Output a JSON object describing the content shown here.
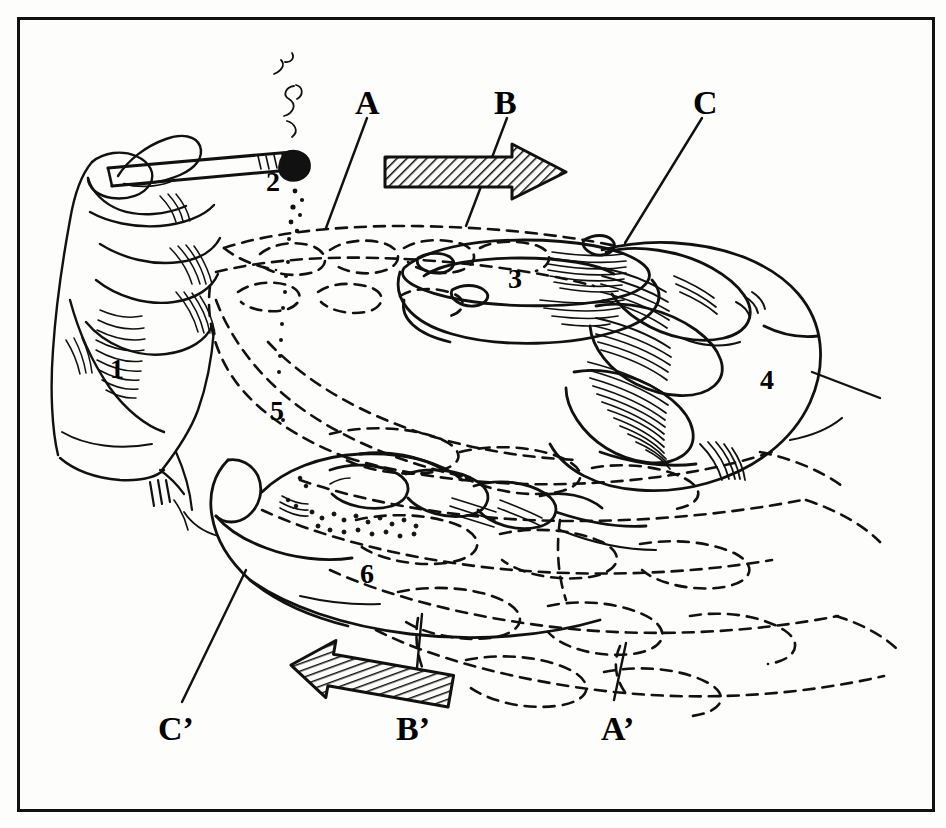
{
  "figure": {
    "type": "technical-line-illustration",
    "background_color": "#fdfdfb",
    "ink_color": "#111111",
    "frame": {
      "stroke": "#111111",
      "width_px": 3
    }
  },
  "section_labels": [
    {
      "id": "A",
      "text": "A",
      "x": 355,
      "y": 86,
      "leader_to": {
        "x": 326,
        "y": 228
      }
    },
    {
      "id": "B",
      "text": "B",
      "x": 494,
      "y": 86,
      "leader_to": {
        "x": 466,
        "y": 226
      }
    },
    {
      "id": "C",
      "text": "C",
      "x": 693,
      "y": 86,
      "leader_to": {
        "x": 625,
        "y": 243
      }
    },
    {
      "id": "Cp",
      "text": "C’",
      "x": 158,
      "y": 712,
      "leader_to": {
        "x": 246,
        "y": 570
      }
    },
    {
      "id": "Bp",
      "text": "B’",
      "x": 396,
      "y": 712,
      "leader_to": {
        "x": 418,
        "y": 618
      }
    },
    {
      "id": "Ap",
      "text": "A’",
      "x": 601,
      "y": 712,
      "leader_to": {
        "x": 620,
        "y": 645
      }
    }
  ],
  "callouts": [
    {
      "id": "1",
      "text": "1",
      "x": 110,
      "y": 355,
      "describes": "lower hand holding cigarette"
    },
    {
      "id": "2",
      "text": "2",
      "x": 266,
      "y": 168,
      "describes": "lit cigarette tip / falling ash"
    },
    {
      "id": "3",
      "text": "3",
      "x": 508,
      "y": 265,
      "describes": "ashtray bowl"
    },
    {
      "id": "4",
      "text": "4",
      "x": 760,
      "y": 366,
      "describes": "upper right hand"
    },
    {
      "id": "5",
      "text": "5",
      "x": 270,
      "y": 397,
      "describes": "phantom outline region"
    },
    {
      "id": "6",
      "text": "6",
      "x": 360,
      "y": 560,
      "describes": "lower left hand palm"
    }
  ],
  "arrows": [
    {
      "id": "arrow-right",
      "direction": "right",
      "hatched": true,
      "x": 385,
      "y": 152,
      "length": 180,
      "angle_deg": 0
    },
    {
      "id": "arrow-left",
      "direction": "left",
      "hatched": true,
      "x": 296,
      "y": 652,
      "length": 160,
      "angle_deg": 10
    }
  ]
}
